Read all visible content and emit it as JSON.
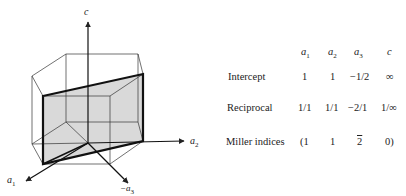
{
  "diagram": {
    "axis_labels": {
      "c": "c",
      "a1": "a",
      "a1_sub": "1",
      "a2": "a",
      "a2_sub": "2",
      "neg_a3": "−a",
      "neg_a3_sub": "3"
    },
    "plane_fill": "#d9d9d9",
    "line_color": "#222222"
  },
  "table": {
    "columns": [
      {
        "base": "a",
        "sub": "1"
      },
      {
        "base": "a",
        "sub": "2"
      },
      {
        "base": "a",
        "sub": "3"
      },
      {
        "base": "c",
        "sub": ""
      }
    ],
    "rows": [
      {
        "label": "Intercept",
        "values": [
          "1",
          "1",
          "−1/2",
          "∞"
        ]
      },
      {
        "label": "Reciprocal",
        "values": [
          "1/1",
          "1/1",
          "−2/1",
          "1/∞"
        ]
      },
      {
        "label": "Miller indices",
        "values": [
          "(1",
          "1",
          "2",
          "0)"
        ],
        "overline_index": 2
      }
    ]
  }
}
